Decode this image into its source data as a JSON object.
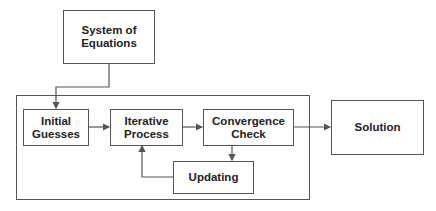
{
  "diagram": {
    "nodes": [
      {
        "id": "system",
        "label": "System of Equations",
        "lines": [
          "System of",
          "Equations"
        ]
      },
      {
        "id": "initial",
        "label": "Initial Guesses",
        "lines": [
          "Initial",
          "Guesses"
        ]
      },
      {
        "id": "iterative",
        "label": "Iterative Process",
        "lines": [
          "Iterative",
          "Process"
        ]
      },
      {
        "id": "convergence",
        "label": "Convergence Check",
        "lines": [
          "Convergence",
          "Check"
        ]
      },
      {
        "id": "updating",
        "label": "Updating",
        "lines": [
          "Updating"
        ]
      },
      {
        "id": "solution",
        "label": "Solution",
        "lines": [
          "Solution"
        ]
      }
    ],
    "edges": [
      {
        "from": "system",
        "to": "initial"
      },
      {
        "from": "initial",
        "to": "iterative"
      },
      {
        "from": "iterative",
        "to": "convergence"
      },
      {
        "from": "convergence",
        "to": "updating"
      },
      {
        "from": "updating",
        "to": "iterative"
      },
      {
        "from": "convergence",
        "to": "solution"
      }
    ],
    "groups": [
      {
        "id": "iteration-loop",
        "members": [
          "initial",
          "iterative",
          "convergence",
          "updating"
        ]
      }
    ],
    "colors": {
      "stroke": "#555555",
      "text": "#222222",
      "background": "#ffffff"
    }
  }
}
